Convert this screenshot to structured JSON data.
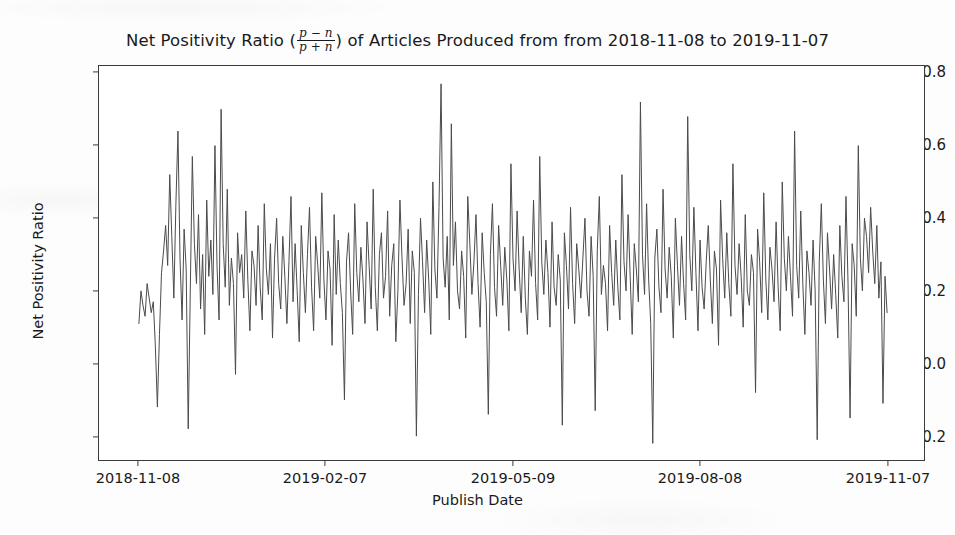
{
  "figure": {
    "background_color": "#ffffff",
    "line_color": "#4b4b4b",
    "axis_color": "#3b3b3b"
  },
  "title": {
    "prefix": "Net Positivity Ratio (",
    "frac_numerator": "p − n",
    "frac_denominator": "p + n",
    "suffix": ") of Articles Produced from from 2018-11-08 to 2019-11-07",
    "full": "Net Positivity Ratio ((p-n)/(p+n)) of Articles Produced from from 2018-11-08 to 2019-11-07"
  },
  "axes": {
    "xlabel": "Publish Date",
    "ylabel": "Net Positivity Ratio",
    "xticks": [
      "2018-11-08",
      "2019-02-07",
      "2019-05-09",
      "2019-08-08",
      "2019-11-07"
    ],
    "yticks": [
      "0.8",
      "0.6",
      "0.4",
      "0.2",
      "0.0",
      "−0.2"
    ]
  },
  "chart_data": {
    "type": "line",
    "xlabel": "Publish Date",
    "ylabel": "Net Positivity Ratio",
    "grid": false,
    "legend": "none",
    "xlim": [
      "2018-11-08",
      "2019-11-07"
    ],
    "ylim": [
      -0.28,
      0.84
    ],
    "xtick_labels": [
      "2018-11-08",
      "2019-02-07",
      "2019-05-09",
      "2019-08-08",
      "2019-11-07"
    ],
    "ytick_values": [
      0.8,
      0.6,
      0.4,
      0.2,
      0.0,
      -0.2
    ],
    "x_start": "2018-11-08",
    "x_end": "2019-11-07",
    "n_points": 365,
    "series": [
      {
        "name": "Net Positivity Ratio",
        "color": "#4b4b4b",
        "line_width": 1.0,
        "values": [
          0.11,
          0.2,
          0.16,
          0.13,
          0.22,
          0.18,
          0.14,
          0.17,
          0.05,
          -0.12,
          0.08,
          0.25,
          0.31,
          0.38,
          0.27,
          0.52,
          0.35,
          0.18,
          0.44,
          0.64,
          0.29,
          0.12,
          0.37,
          0.26,
          -0.18,
          0.2,
          0.57,
          0.33,
          0.22,
          0.41,
          0.15,
          0.3,
          0.08,
          0.45,
          0.24,
          0.34,
          0.19,
          0.6,
          0.27,
          0.12,
          0.7,
          0.33,
          0.21,
          0.48,
          0.16,
          0.29,
          0.22,
          -0.03,
          0.36,
          0.25,
          0.3,
          0.18,
          0.42,
          0.23,
          0.09,
          0.31,
          0.27,
          0.16,
          0.38,
          0.21,
          0.12,
          0.44,
          0.26,
          0.19,
          0.33,
          0.07,
          0.29,
          0.4,
          0.22,
          0.15,
          0.35,
          0.24,
          0.11,
          0.28,
          0.46,
          0.17,
          0.33,
          0.2,
          0.06,
          0.38,
          0.25,
          0.14,
          0.3,
          0.43,
          0.21,
          0.09,
          0.35,
          0.27,
          0.18,
          0.47,
          0.23,
          0.12,
          0.31,
          0.26,
          0.05,
          0.41,
          0.19,
          0.34,
          0.22,
          0.14,
          -0.1,
          0.28,
          0.36,
          0.2,
          0.08,
          0.44,
          0.25,
          0.17,
          0.32,
          0.23,
          0.11,
          0.39,
          0.27,
          0.15,
          0.48,
          0.21,
          0.09,
          0.3,
          0.36,
          0.18,
          0.24,
          0.42,
          0.13,
          0.27,
          0.33,
          0.06,
          0.2,
          0.45,
          0.29,
          0.16,
          0.22,
          0.37,
          0.11,
          0.31,
          0.25,
          -0.2,
          0.19,
          0.4,
          0.28,
          0.14,
          0.34,
          0.23,
          0.08,
          0.5,
          0.26,
          0.18,
          0.43,
          0.77,
          0.29,
          0.21,
          0.35,
          0.12,
          0.66,
          0.27,
          0.39,
          0.2,
          0.15,
          0.31,
          0.24,
          0.07,
          0.46,
          0.33,
          0.19,
          0.28,
          0.41,
          0.22,
          0.1,
          0.36,
          0.25,
          0.17,
          -0.14,
          0.3,
          0.44,
          0.21,
          0.13,
          0.38,
          0.27,
          0.16,
          0.32,
          0.23,
          0.09,
          0.55,
          0.29,
          0.2,
          0.42,
          0.26,
          0.14,
          0.35,
          0.18,
          0.08,
          0.31,
          0.24,
          0.45,
          0.22,
          0.12,
          0.57,
          0.28,
          0.19,
          0.34,
          0.25,
          0.1,
          0.39,
          0.21,
          0.16,
          0.3,
          0.23,
          -0.17,
          0.36,
          0.27,
          0.15,
          0.43,
          0.22,
          0.11,
          0.33,
          0.26,
          0.18,
          0.29,
          0.4,
          0.2,
          0.13,
          0.35,
          0.24,
          -0.13,
          0.31,
          0.46,
          0.19,
          0.27,
          0.22,
          0.09,
          0.38,
          0.25,
          0.16,
          0.34,
          0.21,
          0.12,
          0.52,
          0.28,
          0.2,
          0.41,
          0.24,
          0.08,
          0.33,
          0.26,
          0.17,
          0.72,
          0.3,
          0.19,
          0.44,
          0.23,
          0.11,
          -0.22,
          0.29,
          0.37,
          0.21,
          0.14,
          0.48,
          0.26,
          0.18,
          0.32,
          0.24,
          0.07,
          0.4,
          0.27,
          0.16,
          0.35,
          0.22,
          0.12,
          0.68,
          0.3,
          0.2,
          0.43,
          0.25,
          0.09,
          0.34,
          0.21,
          0.15,
          0.28,
          0.38,
          0.23,
          0.11,
          0.31,
          0.26,
          0.05,
          0.45,
          0.29,
          0.18,
          0.36,
          0.22,
          0.13,
          0.55,
          0.27,
          0.19,
          0.33,
          0.24,
          0.1,
          0.41,
          0.2,
          0.16,
          0.3,
          0.25,
          -0.08,
          0.37,
          0.28,
          0.14,
          0.47,
          0.23,
          0.12,
          0.32,
          0.26,
          0.17,
          0.39,
          0.21,
          0.09,
          0.5,
          0.29,
          0.2,
          0.35,
          0.24,
          0.13,
          0.64,
          0.27,
          0.18,
          0.42,
          0.22,
          0.08,
          0.31,
          0.25,
          0.16,
          0.34,
          0.2,
          -0.21,
          0.28,
          0.44,
          0.23,
          0.11,
          0.36,
          0.26,
          0.15,
          0.3,
          0.19,
          0.07,
          0.38,
          0.24,
          0.17,
          0.46,
          0.22,
          -0.15,
          0.33,
          0.27,
          0.13,
          0.6,
          0.29,
          0.2,
          0.4,
          0.35,
          0.25,
          0.43,
          0.31,
          0.22,
          0.38,
          0.18,
          0.28,
          -0.11,
          0.24,
          0.14
        ]
      }
    ]
  }
}
